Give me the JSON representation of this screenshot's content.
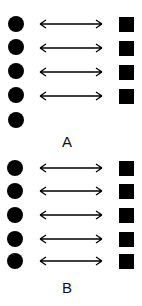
{
  "diagram": {
    "colors": {
      "shape": "#000000",
      "background": "#ffffff"
    },
    "groups": [
      {
        "label": "A",
        "circles": 5,
        "squares": 4,
        "pairs": 4,
        "unmatched": "1 circle"
      },
      {
        "label": "B",
        "circles": 5,
        "squares": 5,
        "pairs": 5,
        "unmatched": "none"
      }
    ]
  }
}
